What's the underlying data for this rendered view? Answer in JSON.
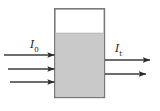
{
  "figure": {
    "width": 160,
    "height": 111,
    "background_color": "#ffffff"
  },
  "labels": {
    "incident": {
      "symbol": "I",
      "subscript": "0",
      "meaning": "incident-intensity"
    },
    "transmitted": {
      "symbol": "I",
      "subscript": "t",
      "meaning": "transmitted-intensity"
    }
  },
  "container": {
    "name": "sample-cell",
    "x": 54,
    "y": 8,
    "width": 51,
    "height": 90,
    "border_color": "#7a7a7a",
    "border_width": 1.6,
    "fill_color": "#ffffff"
  },
  "medium": {
    "name": "absorbing-liquid",
    "x": 55,
    "y": 33,
    "width": 49,
    "height": 64,
    "fill_color": "#c9c9c9",
    "surface_line_color": "#b4b4b4"
  },
  "incident_rays": [
    {
      "x1": 4,
      "y1": 55,
      "x2": 54,
      "y2": 55
    },
    {
      "x1": 8,
      "y1": 69,
      "x2": 54,
      "y2": 69
    },
    {
      "x1": 10,
      "y1": 82,
      "x2": 54,
      "y2": 82
    }
  ],
  "transmitted_rays": [
    {
      "x1": 106,
      "y1": 60,
      "x2": 150,
      "y2": 60
    },
    {
      "x1": 106,
      "y1": 74,
      "x2": 146,
      "y2": 74
    }
  ],
  "arrow_style": {
    "stroke_color": "#3d3d3d",
    "stroke_width": 1.3,
    "head_color": "#2b2b2b",
    "head_length": 7,
    "head_width": 5
  }
}
